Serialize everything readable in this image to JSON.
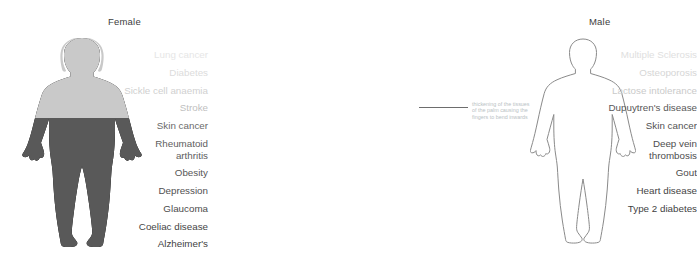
{
  "panels": {
    "female": {
      "title": "Female",
      "figure_style": "filled-silhouette",
      "colors": {
        "upper": "#c9c9c9",
        "lower": "#595959"
      },
      "labels": [
        {
          "text": "Lung cancer",
          "color": "#e6e6e6"
        },
        {
          "text": "Diabetes",
          "color": "#dcdcdc"
        },
        {
          "text": "Sickle cell anaemia",
          "color": "#d0d0d0"
        },
        {
          "text": "Stroke",
          "color": "#bfbfbf"
        },
        {
          "text": "Skin cancer",
          "color": "#6a6a6a"
        },
        {
          "text": "Rheumatoid arthritis",
          "lines": [
            "Rheumatoid",
            "arthritis"
          ],
          "color": "#5e5e5e"
        },
        {
          "text": "Obesity",
          "color": "#575757"
        },
        {
          "text": "Depression",
          "color": "#515151"
        },
        {
          "text": "Glaucoma",
          "color": "#4b4b4b"
        },
        {
          "text": "Coeliac disease",
          "color": "#454545"
        },
        {
          "text": "Alzheimer's",
          "color": "#3f3f3f"
        }
      ]
    },
    "male": {
      "title": "Male",
      "figure_style": "outline-silhouette",
      "colors": {
        "stroke": "#8a8a8a"
      },
      "labels": [
        {
          "text": "Multiple Sclerosis",
          "color": "#e0e0e0"
        },
        {
          "text": "Osteoporosis",
          "color": "#d6d6d6"
        },
        {
          "text": "Lactose intolerance",
          "color": "#cacaca"
        },
        {
          "text": "Dupuytren's disease",
          "color": "#585858",
          "annotated": true
        },
        {
          "text": "Skin cancer",
          "color": "#525252"
        },
        {
          "text": "Deep vein thrombosis",
          "lines": [
            "Deep vein",
            "thrombosis"
          ],
          "color": "#4e4e4e"
        },
        {
          "text": "Gout",
          "color": "#4a4a4a"
        },
        {
          "text": "Heart disease",
          "color": "#444444"
        },
        {
          "text": "Type 2 diabetes",
          "color": "#3f3f3f"
        }
      ]
    }
  },
  "annotation": {
    "lines": [
      "thickening of the tissues",
      "of the palm causing the",
      "fingers to bend inwards"
    ],
    "color": "#b9bfc4"
  }
}
